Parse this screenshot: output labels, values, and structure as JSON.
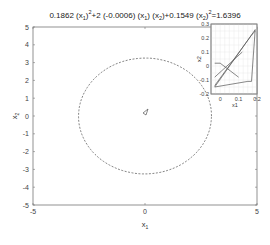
{
  "chart_data": [
    {
      "type": "line",
      "title": "0.1862 (x1)^2+2 (-0.0006) (x1) (x2)+0.1549 (x2)^2=1.6396",
      "xlabel": "x1",
      "ylabel": "x2",
      "xlim": [
        -5,
        5
      ],
      "ylim": [
        -5,
        5
      ],
      "xticks": [
        -5,
        0,
        5
      ],
      "yticks": [
        -5,
        -4,
        -3,
        -2,
        -1,
        0,
        1,
        2,
        3,
        4,
        5
      ],
      "grid": false,
      "series": [
        {
          "name": "ellipse",
          "style": "dashed",
          "equation": {
            "a": 0.1862,
            "b": -0.0006,
            "c": 0.1549,
            "rhs": 1.6396
          },
          "center": [
            0,
            0
          ]
        }
      ],
      "annotations": [
        {
          "type": "small-trajectory-glyph",
          "x": 0,
          "y": 0
        }
      ]
    },
    {
      "type": "line",
      "title": "",
      "xlabel": "x1",
      "ylabel": "x2",
      "xlim": [
        -0.05,
        0.2
      ],
      "ylim": [
        -0.2,
        0.3
      ],
      "xticks": [
        0,
        0.1,
        0.2
      ],
      "yticks": [
        -0.2,
        -0.1,
        0,
        0.1,
        0.2,
        0.3
      ],
      "grid": true,
      "position": "inset-top-right",
      "series": [
        {
          "name": "traj1",
          "x": [
            -0.03,
            0.18,
            0.19
          ],
          "y": [
            -0.15,
            0.24,
            0.26
          ]
        },
        {
          "name": "traj2",
          "x": [
            -0.03,
            0.17,
            0.19
          ],
          "y": [
            -0.14,
            0.22,
            0.25
          ]
        },
        {
          "name": "traj3",
          "x": [
            -0.03,
            0.0,
            0.1
          ],
          "y": [
            0.02,
            0.02,
            -0.08
          ]
        },
        {
          "name": "traj4",
          "x": [
            -0.03,
            0.15,
            0.17
          ],
          "y": [
            -0.15,
            -0.11,
            -0.11
          ]
        },
        {
          "name": "traj5",
          "x": [
            0.19,
            0.17
          ],
          "y": [
            0.26,
            -0.11
          ]
        },
        {
          "name": "traj6",
          "x": [
            -0.03,
            0.12
          ],
          "y": [
            -0.08,
            0.1
          ]
        }
      ]
    }
  ]
}
